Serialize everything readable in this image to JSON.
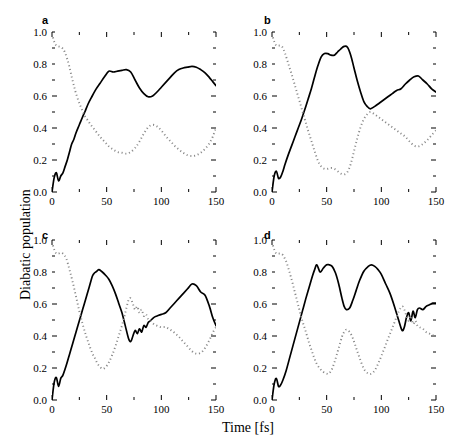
{
  "figure": {
    "ylabel": "Diabatic population",
    "xlabel": "Time [fs]"
  },
  "axes": {
    "xticks": [
      "0",
      "50",
      "100",
      "150"
    ],
    "yticks": [
      "0.0",
      "0.2",
      "0.4",
      "0.6",
      "0.8",
      "1.0"
    ],
    "xlim": [
      0,
      150
    ],
    "ylim": [
      0,
      1
    ],
    "xminor_step": 25,
    "yminor_step": 0.1,
    "frame_color": "#000000"
  },
  "style": {
    "solid_color": "#000000",
    "dotted_color": "#8a8a8a",
    "background": "#ffffff"
  },
  "chart_data": [
    {
      "type": "line",
      "panel": "a",
      "title": "a",
      "xlabel": "Time [fs]",
      "ylabel": "Diabatic population",
      "xlim": [
        0,
        150
      ],
      "ylim": [
        0,
        1
      ],
      "grid": false,
      "legend": "none",
      "x": [
        0,
        2,
        4,
        6,
        8,
        10,
        12,
        14,
        16,
        18,
        20,
        22,
        25,
        28,
        30,
        33,
        36,
        40,
        44,
        48,
        52,
        56,
        60,
        64,
        68,
        72,
        76,
        80,
        84,
        88,
        92,
        96,
        100,
        104,
        108,
        112,
        116,
        120,
        124,
        128,
        132,
        136,
        140,
        144,
        147,
        150
      ],
      "series": [
        {
          "name": "solid",
          "linestyle": "solid",
          "values": [
            0.0,
            0.09,
            0.12,
            0.07,
            0.1,
            0.12,
            0.16,
            0.2,
            0.25,
            0.3,
            0.33,
            0.37,
            0.42,
            0.47,
            0.5,
            0.55,
            0.59,
            0.64,
            0.68,
            0.72,
            0.755,
            0.75,
            0.755,
            0.76,
            0.765,
            0.75,
            0.7,
            0.65,
            0.615,
            0.595,
            0.6,
            0.625,
            0.655,
            0.685,
            0.715,
            0.745,
            0.765,
            0.775,
            0.78,
            0.785,
            0.78,
            0.765,
            0.745,
            0.715,
            0.69,
            0.665
          ]
        },
        {
          "name": "dotted",
          "linestyle": "dotted",
          "values": [
            0.99,
            0.94,
            0.915,
            0.91,
            0.905,
            0.895,
            0.87,
            0.83,
            0.78,
            0.72,
            0.665,
            0.615,
            0.555,
            0.505,
            0.475,
            0.445,
            0.415,
            0.38,
            0.345,
            0.315,
            0.285,
            0.265,
            0.25,
            0.245,
            0.24,
            0.25,
            0.275,
            0.315,
            0.365,
            0.405,
            0.42,
            0.41,
            0.385,
            0.35,
            0.32,
            0.29,
            0.265,
            0.245,
            0.23,
            0.225,
            0.23,
            0.245,
            0.27,
            0.305,
            0.345,
            0.4
          ]
        }
      ]
    },
    {
      "type": "line",
      "panel": "b",
      "title": "b",
      "xlabel": "Time [fs]",
      "ylabel": "Diabatic population",
      "xlim": [
        0,
        150
      ],
      "ylim": [
        0,
        1
      ],
      "grid": false,
      "legend": "none",
      "x": [
        0,
        2,
        4,
        6,
        8,
        10,
        12,
        15,
        18,
        21,
        24,
        27,
        30,
        33,
        36,
        39,
        42,
        45,
        48,
        51,
        54,
        57,
        60,
        63,
        66,
        69,
        72,
        75,
        78,
        81,
        84,
        87,
        90,
        94,
        98,
        102,
        106,
        110,
        114,
        118,
        122,
        126,
        130,
        134,
        138,
        142,
        146,
        150
      ],
      "series": [
        {
          "name": "solid",
          "linestyle": "solid",
          "values": [
            0.0,
            0.1,
            0.13,
            0.085,
            0.095,
            0.13,
            0.175,
            0.235,
            0.29,
            0.345,
            0.4,
            0.455,
            0.515,
            0.58,
            0.645,
            0.72,
            0.79,
            0.845,
            0.865,
            0.865,
            0.855,
            0.855,
            0.875,
            0.895,
            0.91,
            0.905,
            0.855,
            0.775,
            0.695,
            0.625,
            0.565,
            0.535,
            0.52,
            0.535,
            0.555,
            0.575,
            0.595,
            0.615,
            0.635,
            0.645,
            0.675,
            0.7,
            0.72,
            0.725,
            0.7,
            0.675,
            0.645,
            0.625
          ]
        },
        {
          "name": "dotted",
          "linestyle": "dotted",
          "values": [
            0.99,
            0.94,
            0.915,
            0.915,
            0.915,
            0.9,
            0.865,
            0.8,
            0.735,
            0.665,
            0.595,
            0.525,
            0.455,
            0.385,
            0.32,
            0.255,
            0.195,
            0.16,
            0.145,
            0.145,
            0.15,
            0.145,
            0.13,
            0.115,
            0.11,
            0.125,
            0.175,
            0.255,
            0.335,
            0.405,
            0.455,
            0.485,
            0.5,
            0.485,
            0.465,
            0.445,
            0.425,
            0.405,
            0.385,
            0.365,
            0.345,
            0.315,
            0.29,
            0.285,
            0.3,
            0.325,
            0.355,
            0.385
          ]
        }
      ]
    },
    {
      "type": "line",
      "panel": "c",
      "title": "c",
      "xlabel": "Time [fs]",
      "ylabel": "Diabatic population",
      "xlim": [
        0,
        150
      ],
      "ylim": [
        0,
        1
      ],
      "grid": false,
      "legend": "none",
      "x": [
        0,
        2,
        4,
        6,
        8,
        10,
        13,
        16,
        19,
        22,
        25,
        28,
        31,
        34,
        37,
        39,
        41,
        43,
        46,
        49,
        52,
        55,
        58,
        61,
        64,
        67,
        70,
        72,
        74,
        76,
        78,
        80,
        82,
        84,
        86,
        88,
        90,
        93,
        96,
        100,
        104,
        108,
        112,
        116,
        120,
        124,
        128,
        132,
        136,
        140,
        144,
        147,
        150
      ],
      "series": [
        {
          "name": "solid",
          "linestyle": "solid",
          "values": [
            0.0,
            0.11,
            0.14,
            0.085,
            0.135,
            0.155,
            0.215,
            0.285,
            0.355,
            0.425,
            0.495,
            0.565,
            0.635,
            0.705,
            0.775,
            0.795,
            0.805,
            0.815,
            0.8,
            0.78,
            0.755,
            0.715,
            0.665,
            0.605,
            0.545,
            0.465,
            0.385,
            0.365,
            0.4,
            0.435,
            0.415,
            0.445,
            0.425,
            0.465,
            0.455,
            0.485,
            0.495,
            0.515,
            0.525,
            0.535,
            0.545,
            0.575,
            0.605,
            0.635,
            0.665,
            0.695,
            0.725,
            0.715,
            0.675,
            0.655,
            0.585,
            0.515,
            0.465
          ]
        },
        {
          "name": "dotted",
          "linestyle": "dotted",
          "values": [
            0.99,
            0.94,
            0.915,
            0.915,
            0.92,
            0.915,
            0.885,
            0.815,
            0.735,
            0.645,
            0.555,
            0.475,
            0.405,
            0.345,
            0.29,
            0.265,
            0.235,
            0.215,
            0.195,
            0.205,
            0.235,
            0.28,
            0.335,
            0.4,
            0.465,
            0.545,
            0.625,
            0.635,
            0.6,
            0.565,
            0.585,
            0.545,
            0.565,
            0.525,
            0.535,
            0.505,
            0.495,
            0.475,
            0.465,
            0.455,
            0.455,
            0.44,
            0.42,
            0.395,
            0.365,
            0.335,
            0.305,
            0.29,
            0.295,
            0.325,
            0.375,
            0.42,
            0.455
          ]
        }
      ]
    },
    {
      "type": "line",
      "panel": "d",
      "title": "d",
      "xlabel": "Time [fs]",
      "ylabel": "Diabatic population",
      "xlim": [
        0,
        150
      ],
      "ylim": [
        0,
        1
      ],
      "grid": false,
      "legend": "none",
      "x": [
        0,
        2,
        4,
        6,
        8,
        10,
        13,
        16,
        19,
        22,
        25,
        28,
        31,
        34,
        37,
        39,
        41,
        44,
        47,
        50,
        52,
        55,
        58,
        61,
        64,
        66,
        68,
        71,
        74,
        77,
        80,
        84,
        88,
        91,
        94,
        97,
        100,
        104,
        108,
        112,
        116,
        119,
        121,
        123,
        125,
        127,
        129,
        131,
        133,
        135,
        138,
        141,
        144,
        147,
        150
      ],
      "series": [
        {
          "name": "solid",
          "linestyle": "solid",
          "values": [
            0.0,
            0.1,
            0.135,
            0.085,
            0.095,
            0.125,
            0.185,
            0.26,
            0.335,
            0.41,
            0.485,
            0.56,
            0.635,
            0.705,
            0.775,
            0.815,
            0.845,
            0.8,
            0.825,
            0.845,
            0.845,
            0.835,
            0.795,
            0.725,
            0.635,
            0.585,
            0.565,
            0.575,
            0.625,
            0.685,
            0.745,
            0.805,
            0.835,
            0.845,
            0.835,
            0.815,
            0.785,
            0.725,
            0.665,
            0.585,
            0.495,
            0.435,
            0.455,
            0.515,
            0.545,
            0.495,
            0.555,
            0.515,
            0.565,
            0.575,
            0.565,
            0.585,
            0.595,
            0.605,
            0.605
          ]
        },
        {
          "name": "dotted",
          "linestyle": "dotted",
          "values": [
            0.99,
            0.94,
            0.915,
            0.915,
            0.915,
            0.905,
            0.865,
            0.8,
            0.725,
            0.645,
            0.565,
            0.49,
            0.425,
            0.355,
            0.295,
            0.255,
            0.225,
            0.195,
            0.175,
            0.165,
            0.165,
            0.195,
            0.255,
            0.325,
            0.395,
            0.425,
            0.44,
            0.425,
            0.385,
            0.325,
            0.265,
            0.195,
            0.165,
            0.165,
            0.185,
            0.225,
            0.275,
            0.345,
            0.415,
            0.485,
            0.555,
            0.585,
            0.565,
            0.525,
            0.495,
            0.525,
            0.475,
            0.495,
            0.465,
            0.455,
            0.445,
            0.425,
            0.415,
            0.405,
            0.405
          ]
        }
      ]
    }
  ]
}
